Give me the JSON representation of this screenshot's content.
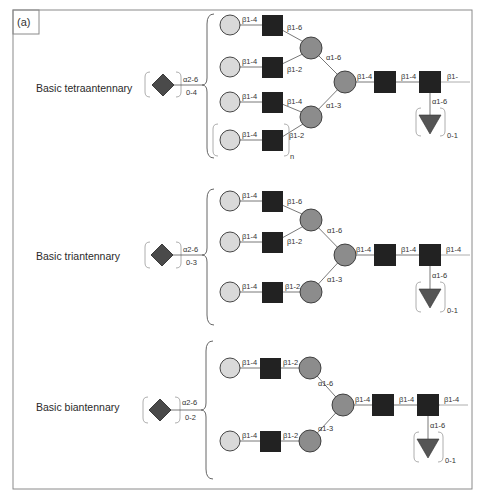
{
  "panel_label": "(a)",
  "colors": {
    "frame": "#8a8a8a",
    "galactose": "#d9d9d9",
    "mannose": "#8c8c8c",
    "glcnac": "#222222",
    "sialic_acid": "#4a4a4a",
    "fucose": "#555555",
    "line": "#555555"
  },
  "legend_shapes": {
    "light_circle": "Galactose (light circle)",
    "dark_circle": "Mannose (grey circle)",
    "black_square": "GlcNAc (black square)",
    "diamond": "Sialic acid (dark diamond)",
    "triangle": "Fucose (dark triangle)"
  },
  "structures": [
    {
      "name": "Basic tetraantennary",
      "sialic": {
        "linkage": "α2-6",
        "count": "0-4"
      },
      "antennae": [
        {
          "gal_glcnac": "β1-4",
          "glcnac_man": "β1-6"
        },
        {
          "gal_glcnac": "β1-4",
          "glcnac_man": "β1-2"
        },
        {
          "gal_glcnac": "β1-4",
          "glcnac_man": "β1-4"
        },
        {
          "gal_glcnac": "β1-4",
          "glcnac_man": "β1-2",
          "repeat": "n"
        }
      ],
      "branch_upper": "α1-6",
      "branch_lower": "α1-3",
      "core_man_glcnac": "β1-4",
      "core_glcnac_glcnac": "β1-4",
      "reducing_end": "β1-",
      "fucose": {
        "linkage": "α1-6",
        "count": "0-1"
      }
    },
    {
      "name": "Basic triantennary",
      "sialic": {
        "linkage": "α2-6",
        "count": "0-3"
      },
      "antennae": [
        {
          "gal_glcnac": "β1-4",
          "glcnac_man": "β1-6"
        },
        {
          "gal_glcnac": "β1-4",
          "glcnac_man": "β1-2"
        },
        {
          "gal_glcnac": "β1-4",
          "glcnac_man": "β1-2"
        }
      ],
      "branch_upper": "α1-6",
      "branch_lower": "α1-3",
      "core_man_glcnac": "β1-4",
      "core_glcnac_glcnac": "β1-4",
      "reducing_end": "β1-4",
      "fucose": {
        "linkage": "α1-6",
        "count": "0-1"
      }
    },
    {
      "name": "Basic biantennary",
      "sialic": {
        "linkage": "α2-6",
        "count": "0-2"
      },
      "antennae": [
        {
          "gal_glcnac": "β1-4",
          "glcnac_man": "β1-2"
        },
        {
          "gal_glcnac": "β1-4",
          "glcnac_man": "β1-2"
        }
      ],
      "branch_upper": "α1-6",
      "branch_lower": "α1-3",
      "core_man_glcnac": "β1-4",
      "core_glcnac_glcnac": "β1-4",
      "reducing_end": "β1-4",
      "fucose": {
        "linkage": "α1-6",
        "count": "0-1"
      }
    }
  ]
}
